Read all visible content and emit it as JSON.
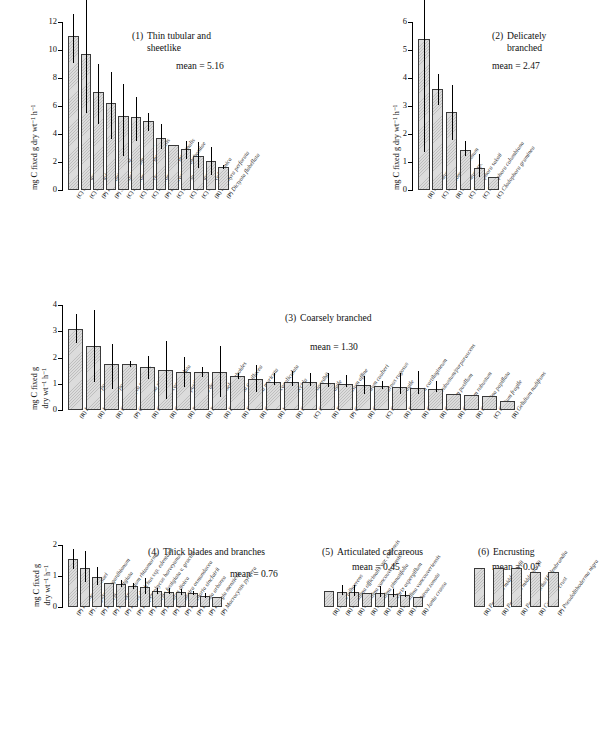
{
  "figure": {
    "top_cut_text": "",
    "axis_label_line1": "mg C fixed g dry wt",
    "axis_label_full": "mg C fixed g dry wt⁻¹ h⁻¹",
    "axis_label_a": "mg C fixed g",
    "axis_label_b": "dry wt⁻¹ h⁻¹",
    "mean_prefix": "mean = "
  },
  "chart_data": [
    {
      "type": "bar",
      "panel": "1",
      "title": "Thin tubular and sheetlike",
      "title_line1": "Thin tubular and",
      "title_line2": "sheetlike",
      "mean": "5.16",
      "ylabel": "mg C fixed g dry wt⁻¹ h⁻¹",
      "ylim": [
        0,
        12
      ],
      "yticks": [
        0,
        2,
        4,
        6,
        8,
        10,
        12
      ],
      "grid": false,
      "categories": [
        "(C) Ulva taeniata",
        "(C) Ulva lobata",
        "(P) Petalonia fascia",
        "(P) Scytosiphon lomentaria",
        "(C) Enteromorpha intestinalis",
        "(C) Ulva rigida",
        "(C) Enteromorpha intestinalis",
        "(P) Endarachne binghamiae",
        "(C) Ulva sp.",
        "(C) Ulva taeniata",
        "(C) Ulva californica",
        "(R) Porphyra perforata",
        "(P) Dictyota flabellata"
      ],
      "values": [
        11.0,
        9.7,
        7.0,
        6.2,
        5.3,
        5.2,
        4.9,
        3.7,
        3.25,
        2.95,
        2.45,
        2.05,
        1.65
      ],
      "err_low": [
        9.1,
        5.5,
        4.7,
        3.65,
        2.45,
        3.5,
        4.25,
        2.95,
        3.25,
        2.2,
        1.6,
        1.05,
        1.5
      ],
      "err_high": [
        12.6,
        15.0,
        9.0,
        8.4,
        7.6,
        6.65,
        5.5,
        4.75,
        3.25,
        3.5,
        3.4,
        3.05,
        1.8
      ]
    },
    {
      "type": "bar",
      "panel": "2",
      "title": "Delicately branched",
      "title_line1": "Delicately",
      "title_line2": "branched",
      "mean": "2.47",
      "ylabel": "mg C fixed g dry wt⁻¹ h⁻¹",
      "ylim": [
        0,
        6
      ],
      "yticks": [
        0,
        1,
        2,
        3,
        4,
        5,
        6
      ],
      "grid": false,
      "categories": [
        "(R) Ceramium sp.",
        "(C) Chaetomorpha linum",
        "(R) Ceramium sp.",
        "(C) Cladophora sakaii",
        "(C) Cladophora columbiana",
        "(C) Cladophora graminea"
      ],
      "values": [
        5.4,
        3.6,
        2.8,
        1.42,
        0.8,
        0.45
      ],
      "err_low": [
        1.35,
        3.05,
        1.8,
        1.2,
        0.45,
        0.45
      ],
      "err_high": [
        6.85,
        4.15,
        3.75,
        1.75,
        1.3,
        0.45
      ]
    },
    {
      "type": "bar",
      "panel": "3",
      "title": "Coarsely branched",
      "title_line1": "Coarsely branched",
      "title_line2": "",
      "mean": "1.30",
      "ylabel": "mg C fixed g dry wt⁻¹ h⁻¹",
      "ylim": [
        0,
        4
      ],
      "yticks": [
        0,
        1,
        2,
        3,
        4
      ],
      "grid": false,
      "categories": [
        "(R) Laurencia pacifica",
        "(R) Laurencia pacifica",
        "(R) Grateloupia setchellii",
        "(P) Colpomenia sinuosa",
        "(R) Gigartina canaliculata",
        "(R) Gelidium pusillum",
        "(R) Neoptilota densa",
        "(R) Nemalion helminthoides",
        "(R) Pterocladia capillacea",
        "(R) Endocladia muricata",
        "(R) Gigartina canaliculata",
        "(R) Iridaea flaccida",
        "(R) Gigartina agardhii",
        "(C) Codium fragile",
        "(R) Rhodoglossum affine",
        "(P) Gastroclonium coulteri",
        "(R) Cylindrocarpus rugosus",
        "(C) Codium fragile",
        "(R) Plocamium cartilagineum",
        "(R) Gelidium robustum/purpurascens",
        "(R) Gelidium pusillum",
        "(R) Gelidium robustum",
        "(R) Gigartina papillata",
        "(C) Codium fragile",
        "(R) Gelidium nudifrons"
      ],
      "values": [
        3.1,
        2.42,
        1.77,
        1.74,
        1.63,
        1.53,
        1.45,
        1.44,
        1.45,
        1.29,
        1.18,
        1.08,
        1.08,
        1.05,
        1.02,
        0.98,
        0.95,
        0.92,
        0.88,
        0.85,
        0.8,
        0.62,
        0.58,
        0.52,
        0.33
      ],
      "err_low": [
        2.55,
        1.05,
        0.8,
        1.63,
        1.18,
        0.42,
        0.88,
        1.26,
        0.48,
        1.18,
        0.68,
        0.95,
        0.92,
        0.9,
        0.88,
        0.88,
        0.62,
        0.8,
        0.62,
        0.62,
        0.68,
        0.62,
        0.58,
        0.52,
        0.33
      ],
      "err_high": [
        3.65,
        3.8,
        2.5,
        1.85,
        2.05,
        2.62,
        2.02,
        1.62,
        2.42,
        1.4,
        1.7,
        1.42,
        1.48,
        1.42,
        1.42,
        1.35,
        1.28,
        1.1,
        1.42,
        1.48,
        1.12,
        0.62,
        0.58,
        0.52,
        0.33
      ]
    },
    {
      "type": "bar",
      "panel": "4",
      "title": "Thick blades and branches",
      "title_line1": "Thick blades and branches",
      "title_line2": "",
      "mean": "0.76",
      "ylabel": "mg C fixed g dry wt⁻¹ h⁻¹",
      "ylim": [
        0,
        2
      ],
      "yticks": [
        0,
        1,
        2
      ],
      "grid": false,
      "categories": [
        "(P) Padina durvillaei",
        "(P) Sargassum agardhianum",
        "(P) Pelvetia fastigiata",
        "(P) Petrospongium rhizomorme",
        "(P) Fucus distichus ssp. edentatus",
        "(P) Hesperophycus harveyanus",
        "(P) Pelvetia fastigiata v. gracilis",
        "(P) Halidrys dioica",
        "(P) Cystoseira osmundacea",
        "(P) Laminaria sinclairii",
        "(P) Eisenia arborea",
        "(P) Egregia menziesii",
        "(P) Macrocystis pyrifera"
      ],
      "values": [
        1.55,
        1.27,
        0.98,
        0.77,
        0.74,
        0.67,
        0.63,
        0.52,
        0.5,
        0.48,
        0.45,
        0.37,
        0.33
      ],
      "err_low": [
        1.22,
        0.8,
        0.72,
        0.77,
        0.63,
        0.58,
        0.42,
        0.43,
        0.42,
        0.4,
        0.38,
        0.3,
        0.33
      ],
      "err_high": [
        1.88,
        1.8,
        1.3,
        0.77,
        0.88,
        0.77,
        0.92,
        0.62,
        0.6,
        0.57,
        0.53,
        0.45,
        0.33
      ]
    },
    {
      "type": "bar",
      "panel": "5",
      "title": "Articulated calcareous",
      "title_line1": "Articulated calcareous",
      "title_line2": "",
      "mean": "0.45",
      "ylim": [
        0,
        2
      ],
      "yticks": [],
      "grid": false,
      "categories": [
        "(R) Jania adhaerens",
        "(R) Corallina officinalis var. chilensis",
        "(R) Corallina vancouveriensis",
        "(R) Corallina pinnatifolia",
        "(R) Lithothrix aspergillum",
        "(R) Corallina vancouveriensis",
        "(R) Amphiroa zonata",
        "(R) Jania crassa"
      ],
      "values": [
        0.52,
        0.5,
        0.5,
        0.45,
        0.45,
        0.42,
        0.4,
        0.33
      ],
      "err_low": [
        0.52,
        0.38,
        0.36,
        0.45,
        0.33,
        0.32,
        0.32,
        0.33
      ],
      "err_high": [
        0.52,
        0.72,
        0.7,
        0.45,
        0.68,
        0.58,
        0.52,
        0.33
      ]
    },
    {
      "type": "bar",
      "panel": "6",
      "title": "Encrusting",
      "title_line1": "Encrusting",
      "title_line2": "",
      "mean": "0.07",
      "ylim": [
        0,
        2
      ],
      "yticks": [],
      "grid": false,
      "categories": [
        "(R) Petrocelis middendorfii",
        "(R) Petrocelis middendorfii",
        "(R) Peyssonnelia/Hildenbrandia",
        "(R) Coralline crust",
        "(P) Pseudolithoderma nigra"
      ],
      "values": [
        0.09,
        0.09,
        0.09,
        0.08,
        0.08
      ],
      "err_low": [
        0.09,
        0.09,
        0.09,
        0.08,
        0.08
      ],
      "err_high": [
        0.09,
        0.09,
        0.09,
        0.08,
        0.08
      ]
    }
  ]
}
